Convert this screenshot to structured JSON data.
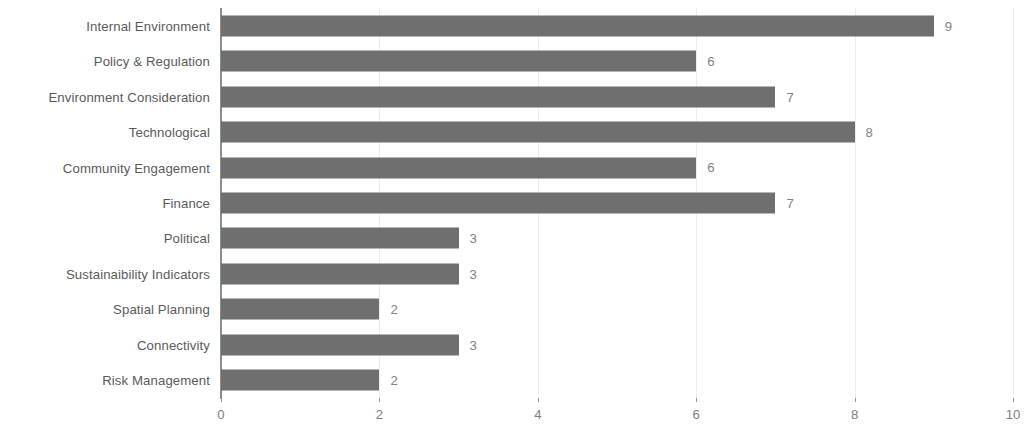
{
  "chart_data": {
    "type": "bar",
    "orientation": "horizontal",
    "title": "",
    "subtitle": "",
    "xlabel": "",
    "ylabel": "",
    "categories": [
      "Internal Environment",
      "Policy & Regulation",
      "Environment Consideration",
      "Technological",
      "Community Engagement",
      "Finance",
      "Political",
      "Sustainaibility Indicators",
      "Spatial Planning",
      "Connectivity",
      "Risk Management"
    ],
    "values": [
      9,
      6,
      7,
      8,
      6,
      7,
      3,
      3,
      2,
      3,
      2
    ],
    "data_labels": [
      "9",
      "6",
      "7",
      "8",
      "6",
      "7",
      "3",
      "3",
      "2",
      "3",
      "2"
    ],
    "xlim": [
      0,
      10
    ],
    "xticks": [
      0,
      2,
      4,
      6,
      8,
      10
    ],
    "xtick_labels": [
      "0",
      "2",
      "4",
      "6",
      "8",
      "10"
    ],
    "grid": {
      "vertical": true,
      "horizontal": false
    },
    "legend": {
      "visible": false,
      "position": "none"
    },
    "colors": {
      "bar_fill": "#6f6f6f",
      "background": "#ffffff",
      "category_label": "#5a5a5a",
      "value_label": "#828282",
      "axis_line": "#8c8c8c",
      "gridline": "#ececec",
      "tick_label": "#7e7e7e"
    }
  }
}
